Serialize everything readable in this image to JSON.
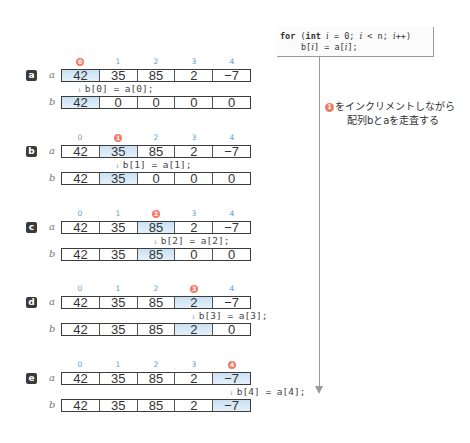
{
  "code": {
    "line1": [
      "for",
      " (",
      "int",
      " ",
      "i",
      " = 0; ",
      "i",
      " < n; ",
      "i",
      "++)"
    ],
    "line2": [
      "b[",
      "i",
      "] = a[",
      "i",
      "];"
    ]
  },
  "note": {
    "marker": "1",
    "line1": "をインクリメントしながら",
    "line2": "配列bとaを走査する"
  },
  "colors": {
    "highlight": "#c9e1f4",
    "index_label": "#5a9fd4",
    "current_marker": "#f07a66",
    "badge": "#3a3a3a"
  },
  "var_labels": {
    "a": "a",
    "b": "b"
  },
  "down_arrow": "↓",
  "steps": [
    {
      "badge": "a",
      "current_index": 0,
      "indices": [
        "0",
        "1",
        "2",
        "3",
        "4"
      ],
      "a": [
        "42",
        "35",
        "85",
        "2",
        "−7"
      ],
      "b": [
        "42",
        "0",
        "0",
        "0",
        "0"
      ],
      "code": "b[0] = a[0];"
    },
    {
      "badge": "b",
      "current_index": 1,
      "indices": [
        "0",
        "1",
        "2",
        "3",
        "4"
      ],
      "a": [
        "42",
        "35",
        "85",
        "2",
        "−7"
      ],
      "b": [
        "42",
        "35",
        "0",
        "0",
        "0"
      ],
      "code": "b[1] = a[1];"
    },
    {
      "badge": "c",
      "current_index": 2,
      "indices": [
        "0",
        "1",
        "2",
        "3",
        "4"
      ],
      "a": [
        "42",
        "35",
        "85",
        "2",
        "−7"
      ],
      "b": [
        "42",
        "35",
        "85",
        "0",
        "0"
      ],
      "code": "b[2] = a[2];"
    },
    {
      "badge": "d",
      "current_index": 3,
      "indices": [
        "0",
        "1",
        "2",
        "3",
        "4"
      ],
      "a": [
        "42",
        "35",
        "85",
        "2",
        "−7"
      ],
      "b": [
        "42",
        "35",
        "85",
        "2",
        "0"
      ],
      "code": "b[3] = a[3];"
    },
    {
      "badge": "e",
      "current_index": 4,
      "indices": [
        "0",
        "1",
        "2",
        "3",
        "4"
      ],
      "a": [
        "42",
        "35",
        "85",
        "2",
        "−7"
      ],
      "b": [
        "42",
        "35",
        "85",
        "2",
        "−7"
      ],
      "code": "b[4] = a[4];"
    }
  ]
}
